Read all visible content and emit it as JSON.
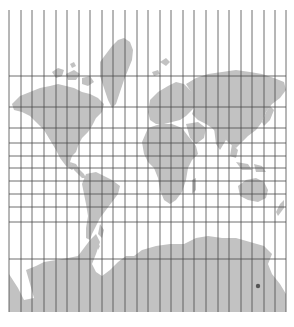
{
  "map": {
    "title": "Mercator world map with graticule",
    "projection": "Mercator",
    "colors": {
      "background": "#ffffff",
      "land": "#c2c2c2",
      "grid": "#4a4a4a",
      "marker": "#555555"
    },
    "frame": {
      "left": 9,
      "top": 10,
      "right": 286,
      "bottom": 312
    },
    "meridians_x": [
      9,
      21,
      32,
      44,
      56,
      67,
      79,
      90,
      102,
      113,
      125,
      137,
      148,
      160,
      171,
      183,
      194,
      206,
      218,
      229,
      241,
      252,
      264,
      275,
      286
    ],
    "parallels_y": [
      76,
      107,
      128,
      143,
      156,
      168,
      181,
      194,
      207,
      222,
      259
    ],
    "marker": {
      "x": 258,
      "y": 286,
      "label": ""
    }
  }
}
